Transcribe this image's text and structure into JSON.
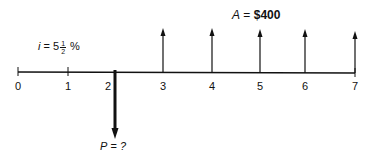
{
  "diagram": {
    "type": "cash-flow-diagram",
    "interest_label": {
      "var": "i",
      "eq": "=",
      "whole": "5",
      "frac_num": "1",
      "frac_den": "2",
      "unit": "%"
    },
    "annuity_label": {
      "var": "A",
      "eq": "=",
      "value": "$400"
    },
    "present_label": {
      "var": "P",
      "eq": "=",
      "value": "?"
    },
    "periods": [
      "0",
      "1",
      "2",
      "3",
      "4",
      "5",
      "6",
      "7"
    ],
    "tick_x": [
      18,
      68,
      115,
      163,
      212,
      260,
      305,
      355
    ],
    "up_arrow_periods": [
      3,
      4,
      5,
      6,
      7
    ],
    "down_arrow_period": 2,
    "colors": {
      "line": "#111111",
      "background": "#ffffff"
    }
  }
}
